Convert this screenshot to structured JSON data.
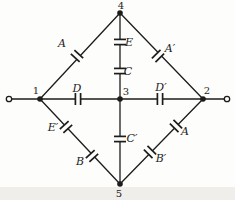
{
  "figure": {
    "type": "circuit-diagram",
    "background": "#fdfdfc",
    "ink": "#1c1c1c",
    "scan_band_color": "#d9d6cf",
    "nodes": [
      {
        "id": "node-1",
        "x": 40,
        "y": 99,
        "label": "1",
        "lx": 36,
        "ly": 90
      },
      {
        "id": "node-2",
        "x": 203,
        "y": 99,
        "label": "2",
        "lx": 207,
        "ly": 90
      },
      {
        "id": "node-3",
        "x": 120,
        "y": 99,
        "label": "3",
        "lx": 126,
        "ly": 91
      },
      {
        "id": "node-4",
        "x": 120,
        "y": 13,
        "label": "4",
        "lx": 121,
        "ly": 5
      },
      {
        "id": "node-5",
        "x": 120,
        "y": 184,
        "label": "5",
        "lx": 119,
        "ly": 193
      }
    ],
    "terminals": [
      {
        "id": "terminal-left",
        "x": 9,
        "y": 99
      },
      {
        "id": "terminal-right",
        "x": 227,
        "y": 99
      }
    ],
    "wires": [
      {
        "id": "wire-terminal-left",
        "x1": 12,
        "y1": 99,
        "x2": 40,
        "y2": 99
      },
      {
        "id": "wire-1-4",
        "x1": 40,
        "y1": 99,
        "x2": 120,
        "y2": 13
      },
      {
        "id": "wire-4-2",
        "x1": 120,
        "y1": 13,
        "x2": 203,
        "y2": 99
      },
      {
        "id": "wire-1-3",
        "x1": 40,
        "y1": 99,
        "x2": 120,
        "y2": 99
      },
      {
        "id": "wire-3-2",
        "x1": 120,
        "y1": 99,
        "x2": 203,
        "y2": 99
      },
      {
        "id": "wire-4-3",
        "x1": 120,
        "y1": 13,
        "x2": 120,
        "y2": 99
      },
      {
        "id": "wire-1-5",
        "x1": 40,
        "y1": 99,
        "x2": 120,
        "y2": 184
      },
      {
        "id": "wire-3-5",
        "x1": 120,
        "y1": 99,
        "x2": 120,
        "y2": 184
      },
      {
        "id": "wire-2-5",
        "x1": 203,
        "y1": 99,
        "x2": 120,
        "y2": 184
      },
      {
        "id": "wire-terminal-right",
        "x1": 203,
        "y1": 99,
        "x2": 224,
        "y2": 99
      }
    ],
    "capacitors": [
      {
        "id": "capacitor-A-branch-1-4",
        "x": 77,
        "y": 56,
        "angle": -47,
        "label": "A",
        "lx": 62,
        "ly": 43
      },
      {
        "id": "capacitor-A-prime-branch-4-2",
        "x": 158,
        "y": 56,
        "angle": 46,
        "label": "A′",
        "lx": 170,
        "ly": 48
      },
      {
        "id": "capacitor-E-branch-4-3",
        "x": 120,
        "y": 42,
        "angle": 90,
        "label": "E",
        "lx": 129,
        "ly": 42
      },
      {
        "id": "capacitor-C-branch-4-3",
        "x": 120,
        "y": 71,
        "angle": 90,
        "label": "C",
        "lx": 128,
        "ly": 71
      },
      {
        "id": "capacitor-D-branch-1-3",
        "x": 78,
        "y": 99,
        "angle": 0,
        "label": "D",
        "lx": 77,
        "ly": 88
      },
      {
        "id": "capacitor-D-prime-branch-3-2",
        "x": 160,
        "y": 99,
        "angle": 0,
        "label": "D′",
        "lx": 161,
        "ly": 87
      },
      {
        "id": "capacitor-E-prime-branch-1-5",
        "x": 66,
        "y": 127,
        "angle": 47,
        "label": "E′",
        "lx": 53,
        "ly": 127
      },
      {
        "id": "capacitor-B-branch-1-5",
        "x": 92,
        "y": 156,
        "angle": 47,
        "label": "B",
        "lx": 80,
        "ly": 161
      },
      {
        "id": "capacitor-C-prime-branch-3-5",
        "x": 120,
        "y": 139,
        "angle": 90,
        "label": "C′",
        "lx": 132,
        "ly": 138
      },
      {
        "id": "capacitor-A-branch-2-5",
        "x": 176,
        "y": 126,
        "angle": 134,
        "label": "A",
        "lx": 185,
        "ly": 131
      },
      {
        "id": "capacitor-B-prime-branch-2-5",
        "x": 150,
        "y": 152,
        "angle": 134,
        "label": "B′",
        "lx": 161,
        "ly": 158
      }
    ]
  }
}
